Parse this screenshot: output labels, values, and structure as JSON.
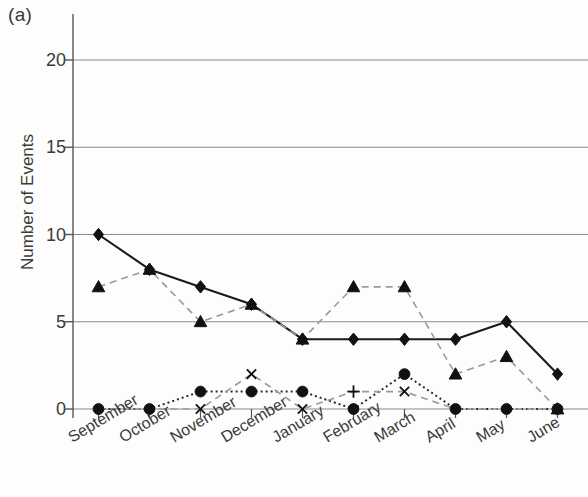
{
  "figure": {
    "panel_label": "(a)"
  },
  "axes": {
    "ylabel": "Number of Events",
    "yticks": [
      0,
      5,
      10,
      15,
      20
    ],
    "ytick_labels": [
      "0",
      "5",
      "10",
      "15",
      "20"
    ],
    "xtick_labels": [
      "September",
      "October",
      "November",
      "December",
      "January",
      "February",
      "March",
      "April",
      "May",
      "June"
    ]
  },
  "style": {
    "axis_color": "#555555",
    "grid_color": "#8a8a8a",
    "solid_series_color": "#1a1a1a",
    "dashed_series_color": "#9a9a9a",
    "dotted_series_color": "#2a2a2a",
    "marker_color": "#111111",
    "background": "#ffffff"
  },
  "chart_data": {
    "type": "line",
    "title": "(a)",
    "xlabel": "",
    "ylabel": "Number of Events",
    "categories": [
      "September",
      "October",
      "November",
      "December",
      "January",
      "February",
      "March",
      "April",
      "May",
      "June"
    ],
    "ylim": [
      0,
      22
    ],
    "yticks": [
      0,
      5,
      10,
      15,
      20
    ],
    "grid": "horizontal",
    "legend": "none",
    "series": [
      {
        "name": "series-diamond",
        "marker": "diamond",
        "line": "solid",
        "color": "#1a1a1a",
        "values": [
          10,
          8,
          7,
          6,
          4,
          4,
          4,
          4,
          5,
          2
        ]
      },
      {
        "name": "series-triangle",
        "marker": "triangle",
        "line": "dashed",
        "color": "#9a9a9a",
        "values": [
          7,
          8,
          5,
          6,
          4,
          7,
          7,
          2,
          3,
          0
        ]
      },
      {
        "name": "series-circle",
        "marker": "circle",
        "line": "dotted",
        "color": "#2a2a2a",
        "values": [
          0,
          0,
          1,
          1,
          1,
          0,
          2,
          0,
          0,
          0
        ]
      },
      {
        "name": "series-plus",
        "marker": "plus-cross",
        "line": "dashed",
        "color": "#9a9a9a",
        "values": [
          0,
          0,
          0,
          2,
          0,
          1,
          1,
          0,
          0,
          0
        ],
        "cross_marker_months": [
          "November",
          "December",
          "January",
          "March"
        ]
      }
    ]
  }
}
